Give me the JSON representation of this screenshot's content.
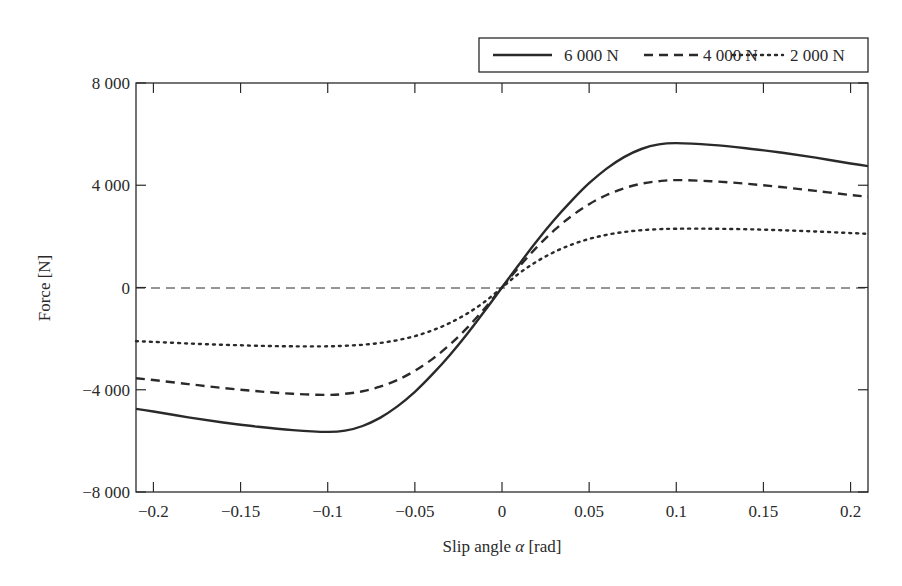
{
  "chart_data": {
    "type": "line",
    "title": "",
    "xlabel": "Slip angle α [rad]",
    "xlabel_parts": {
      "pre": "Slip angle ",
      "symbol": "α",
      "post": " [rad]"
    },
    "ylabel": "Force [N]",
    "xlim": [
      -0.21,
      0.21
    ],
    "ylim": [
      -8000,
      8000
    ],
    "x_ticks": [
      -0.2,
      -0.15,
      -0.1,
      -0.05,
      0,
      0.05,
      0.1,
      0.15,
      0.2
    ],
    "x_tick_labels": [
      "−0.2",
      "−0.15",
      "−0.1",
      "−0.05",
      "0",
      "0.05",
      "0.1",
      "0.15",
      "0.2"
    ],
    "y_ticks": [
      -8000,
      -4000,
      0,
      4000,
      8000
    ],
    "y_tick_labels": [
      "−8 000",
      "−4 000",
      "0",
      "4 000",
      "8 000"
    ],
    "grid": false,
    "zero_line": {
      "style": "dashed",
      "y": 0
    },
    "legend_position": "top-right, above plot",
    "x": [
      -0.21,
      -0.2,
      -0.18,
      -0.16,
      -0.14,
      -0.12,
      -0.1,
      -0.09,
      -0.08,
      -0.07,
      -0.06,
      -0.05,
      -0.04,
      -0.03,
      -0.02,
      -0.01,
      0,
      0.01,
      0.02,
      0.03,
      0.04,
      0.05,
      0.06,
      0.07,
      0.08,
      0.09,
      0.1,
      0.12,
      0.14,
      0.16,
      0.18,
      0.2,
      0.21
    ],
    "series": [
      {
        "name": "6 000 N",
        "label": "6 000 N",
        "style": "solid",
        "values": [
          -4750,
          -4850,
          -5080,
          -5280,
          -5450,
          -5580,
          -5650,
          -5600,
          -5420,
          -5100,
          -4650,
          -4080,
          -3400,
          -2650,
          -1820,
          -920,
          0,
          920,
          1820,
          2650,
          3400,
          4080,
          4650,
          5100,
          5420,
          5600,
          5650,
          5580,
          5450,
          5280,
          5080,
          4850,
          4750
        ]
      },
      {
        "name": "4 000 N",
        "label": "4 000 N",
        "style": "dashed",
        "values": [
          -3550,
          -3620,
          -3780,
          -3930,
          -4060,
          -4160,
          -4200,
          -4160,
          -4060,
          -3880,
          -3620,
          -3260,
          -2800,
          -2240,
          -1580,
          -820,
          0,
          820,
          1580,
          2240,
          2800,
          3260,
          3620,
          3880,
          4060,
          4160,
          4200,
          4160,
          4060,
          3930,
          3780,
          3620,
          3550
        ]
      },
      {
        "name": "2 000 N",
        "label": "2 000 N",
        "style": "dotted",
        "values": [
          -2100,
          -2130,
          -2190,
          -2240,
          -2280,
          -2300,
          -2300,
          -2280,
          -2240,
          -2170,
          -2060,
          -1900,
          -1680,
          -1390,
          -1020,
          -560,
          0,
          560,
          1020,
          1390,
          1680,
          1900,
          2060,
          2170,
          2240,
          2280,
          2300,
          2300,
          2280,
          2240,
          2190,
          2130,
          2100
        ]
      }
    ]
  },
  "legend": {
    "items": [
      {
        "label": "6 000 N",
        "style": "solid"
      },
      {
        "label": "4 000 N",
        "style": "dashed"
      },
      {
        "label": "2 000 N",
        "style": "dotted"
      }
    ]
  }
}
